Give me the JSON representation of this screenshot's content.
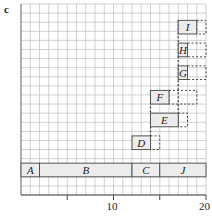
{
  "panel_label": "c",
  "axis": {
    "x_min": 0,
    "x_max": 20,
    "tick_labels": [
      {
        "value": 10,
        "label": "10"
      },
      {
        "value": 20,
        "label": "20"
      }
    ],
    "minor_ticks": [
      5,
      15
    ]
  },
  "grid": {
    "columns": 20,
    "rows": 21,
    "color": "#bdbdbd"
  },
  "bars": [
    {
      "id": "A",
      "label": "A",
      "start": 0,
      "end": 2,
      "row": 2,
      "dashed_end": null
    },
    {
      "id": "B",
      "label": "B",
      "start": 2,
      "end": 12,
      "row": 2,
      "dashed_end": null
    },
    {
      "id": "C",
      "label": "C",
      "start": 12,
      "end": 15,
      "row": 2,
      "dashed_end": null
    },
    {
      "id": "J",
      "label": "J",
      "start": 15,
      "end": 20,
      "row": 2,
      "dashed_end": null
    },
    {
      "id": "D",
      "label": "D",
      "start": 12,
      "end": 14,
      "row": 5,
      "dashed_end": 15
    },
    {
      "id": "E",
      "label": "E",
      "start": 14,
      "end": 17,
      "row": 7.5,
      "dashed_end": 18
    },
    {
      "id": "F",
      "label": "F",
      "start": 14,
      "end": 16,
      "row": 10,
      "dashed_end": 19
    },
    {
      "id": "G",
      "label": "G",
      "start": 17,
      "end": 18,
      "row": 12.7,
      "dashed_end": 20
    },
    {
      "id": "H",
      "label": "H",
      "start": 17,
      "end": 18,
      "row": 15.2,
      "dashed_end": 20
    },
    {
      "id": "I",
      "label": "I",
      "start": 17,
      "end": 19,
      "row": 17.7,
      "dashed_end": 20
    }
  ],
  "dashed_verticals": [
    {
      "x": 14,
      "from_row": 5,
      "to_row": 11.5
    },
    {
      "x": 17,
      "from_row": 7.5,
      "to_row": 19.2
    }
  ],
  "colors": {
    "bar_fill": "#ececec",
    "bar_stroke": "#555555",
    "dash": "#333333"
  }
}
